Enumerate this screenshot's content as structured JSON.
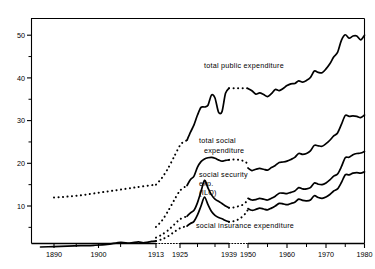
{
  "chart_data": {
    "type": "line",
    "title": "",
    "subtitle": "",
    "xlabel": "",
    "ylabel": "",
    "xlim": [
      1885,
      1980
    ],
    "ylim": [
      0,
      53
    ],
    "grid": false,
    "legend_position": "inline-annotations",
    "yticks_major": [
      10,
      20,
      30,
      40,
      50
    ],
    "yticks_minor": [
      5,
      15,
      25,
      35,
      45
    ],
    "xticks": [
      1890,
      1900,
      1913,
      1925,
      1939,
      1950,
      1960,
      1970,
      1980
    ],
    "xtick_labels": [
      "1890",
      "1900",
      "1913",
      "1925",
      "1939",
      "1950",
      "1960",
      "1970",
      "1980"
    ],
    "axis_break_spans": [
      [
        1913,
        1925
      ],
      [
        1939,
        1950
      ]
    ],
    "series": [
      {
        "name": "total public expenditure",
        "style": "mixed",
        "label_x": 1944,
        "label_y": 40.5,
        "segments": [
          {
            "style": "dotted",
            "x": [
              1890,
              1892,
              1894,
              1896,
              1898,
              1900,
              1902,
              1904,
              1906,
              1908,
              1910,
              1913
            ],
            "y": [
              12.0,
              12.1,
              12.3,
              12.5,
              12.8,
              13.1,
              13.4,
              13.7,
              14.0,
              14.3,
              14.6,
              15.0
            ]
          },
          {
            "style": "dotted",
            "x": [
              1913,
              1916,
              1919,
              1922,
              1925,
              1926,
              1927
            ],
            "y": [
              15.0,
              16.6,
              18.8,
              21.5,
              24.2,
              25.0,
              25.4
            ]
          },
          {
            "style": "solid",
            "x": [
              1927,
              1928,
              1929,
              1930,
              1931,
              1932,
              1933,
              1934,
              1935,
              1936,
              1937,
              1938,
              1939
            ],
            "y": [
              25.4,
              27.3,
              29.0,
              31.3,
              33.1,
              33.2,
              33.6,
              36.0,
              35.3,
              32.0,
              32.1,
              36.4,
              37.6
            ]
          },
          {
            "style": "dotted",
            "x": [
              1939,
              1942,
              1945,
              1948,
              1950
            ],
            "y": [
              37.6,
              37.6,
              37.6,
              37.6,
              37.6
            ]
          },
          {
            "style": "solid",
            "x": [
              1950,
              1951,
              1952,
              1953,
              1954,
              1955,
              1956,
              1957,
              1958,
              1959,
              1960,
              1961,
              1962,
              1963,
              1964,
              1965,
              1966,
              1967,
              1968,
              1969,
              1970,
              1971,
              1972,
              1973,
              1974,
              1975,
              1976,
              1977,
              1978,
              1979,
              1980
            ],
            "y": [
              37.5,
              37.0,
              36.2,
              36.5,
              36.1,
              35.6,
              36.3,
              37.3,
              37.0,
              37.5,
              38.2,
              38.6,
              38.7,
              39.3,
              39.0,
              39.4,
              40.1,
              41.6,
              41.3,
              41.2,
              42.1,
              43.3,
              44.9,
              46.0,
              48.8,
              50.1,
              49.3,
              49.8,
              49.8,
              48.9,
              50.0
            ]
          }
        ]
      },
      {
        "name": "total social expenditure",
        "style": "mixed",
        "label_x": 1941,
        "label_y": 27.5,
        "label_line2_y": 24.8,
        "segments": [
          {
            "style": "dotted",
            "x": [
              1913,
              1916,
              1919,
              1922,
              1925,
              1927
            ],
            "y": [
              5.1,
              6.6,
              8.8,
              11.3,
              13.6,
              14.8
            ]
          },
          {
            "style": "solid",
            "x": [
              1927,
              1928,
              1929,
              1930,
              1931,
              1932,
              1933,
              1934,
              1935,
              1936,
              1937,
              1938,
              1939
            ],
            "y": [
              14.8,
              16.2,
              17.0,
              19.1,
              20.4,
              21.0,
              21.3,
              21.4,
              21.2,
              20.8,
              20.5,
              20.7,
              20.8
            ]
          },
          {
            "style": "dotted",
            "x": [
              1939,
              1941,
              1943,
              1945,
              1947,
              1949,
              1950
            ],
            "y": [
              20.8,
              20.9,
              20.9,
              20.8,
              20.6,
              20.2,
              19.3
            ]
          },
          {
            "style": "solid",
            "x": [
              1950,
              1951,
              1952,
              1953,
              1954,
              1955,
              1956,
              1957,
              1958,
              1959,
              1960,
              1961,
              1962,
              1963,
              1964,
              1965,
              1966,
              1967,
              1968,
              1969,
              1970,
              1971,
              1972,
              1973,
              1974,
              1975,
              1976,
              1977,
              1978,
              1979,
              1980
            ],
            "y": [
              18.9,
              18.3,
              18.6,
              18.8,
              18.6,
              18.4,
              19.0,
              19.5,
              20.2,
              20.3,
              20.5,
              20.9,
              21.4,
              22.3,
              22.1,
              22.3,
              22.9,
              24.2,
              24.1,
              24.0,
              24.6,
              25.4,
              26.4,
              27.1,
              29.1,
              31.2,
              31.0,
              31.1,
              31.0,
              30.7,
              31.3
            ]
          }
        ]
      },
      {
        "name": "social security exp. (ILO)",
        "style": "mixed",
        "label_x": 1941,
        "label_y": 18.6,
        "segments": [
          {
            "style": "dotted",
            "x": [
              1913,
              1916,
              1919,
              1922,
              1925,
              1927
            ],
            "y": [
              2.6,
              3.3,
              4.3,
              5.6,
              6.9,
              7.6
            ]
          },
          {
            "style": "solid",
            "x": [
              1927,
              1928,
              1929,
              1930,
              1931,
              1932,
              1933,
              1934,
              1935,
              1936,
              1937,
              1938,
              1939
            ],
            "y": [
              7.6,
              8.4,
              9.0,
              10.8,
              13.4,
              16.0,
              14.2,
              12.6,
              11.6,
              11.1,
              10.6,
              10.0,
              9.6
            ]
          },
          {
            "style": "dotted",
            "x": [
              1939,
              1941,
              1943,
              1945,
              1947,
              1949,
              1950
            ],
            "y": [
              9.6,
              9.6,
              9.8,
              10.0,
              10.3,
              11.0,
              11.6
            ]
          },
          {
            "style": "solid",
            "x": [
              1950,
              1951,
              1952,
              1953,
              1954,
              1955,
              1956,
              1957,
              1958,
              1959,
              1960,
              1961,
              1962,
              1963,
              1964,
              1965,
              1966,
              1967,
              1968,
              1969,
              1970,
              1971,
              1972,
              1973,
              1974,
              1975,
              1976,
              1977,
              1978,
              1979,
              1980
            ],
            "y": [
              11.8,
              11.4,
              11.5,
              11.8,
              11.6,
              11.4,
              11.8,
              12.3,
              13.0,
              13.0,
              12.9,
              13.2,
              13.5,
              14.3,
              14.0,
              14.0,
              14.3,
              15.4,
              15.1,
              15.0,
              15.4,
              16.1,
              17.0,
              17.5,
              19.2,
              21.3,
              21.4,
              22.0,
              22.3,
              22.4,
              22.8
            ]
          }
        ]
      },
      {
        "name": "social insurance expenditure",
        "style": "mixed",
        "label_x": 1944,
        "label_y": 4.5,
        "segments": [
          {
            "style": "solid",
            "x": [
              1887,
              1890,
              1893,
              1896,
              1899,
              1902,
              1905,
              1907,
              1909,
              1910,
              1911,
              1912,
              1913
            ],
            "y": [
              0.4,
              0.5,
              0.6,
              0.7,
              0.8,
              1.0,
              1.5,
              1.3,
              1.6,
              1.4,
              1.5,
              1.7,
              1.8
            ]
          },
          {
            "style": "dotted",
            "x": [
              1913,
              1916,
              1919,
              1922,
              1925,
              1927
            ],
            "y": [
              1.8,
              2.2,
              2.9,
              3.9,
              4.8,
              5.3
            ]
          },
          {
            "style": "solid",
            "x": [
              1927,
              1928,
              1929,
              1930,
              1931,
              1932,
              1933,
              1934,
              1935,
              1936,
              1937,
              1938,
              1939
            ],
            "y": [
              5.3,
              5.9,
              6.4,
              7.9,
              10.0,
              12.1,
              10.3,
              8.7,
              7.8,
              7.3,
              7.0,
              6.6,
              6.3
            ]
          },
          {
            "style": "dotted",
            "x": [
              1939,
              1941,
              1943,
              1945,
              1947,
              1949,
              1950
            ],
            "y": [
              6.3,
              6.4,
              6.6,
              7.0,
              7.6,
              8.5,
              9.2
            ]
          },
          {
            "style": "solid",
            "x": [
              1950,
              1951,
              1952,
              1953,
              1954,
              1955,
              1956,
              1957,
              1958,
              1959,
              1960,
              1961,
              1962,
              1963,
              1964,
              1965,
              1966,
              1967,
              1968,
              1969,
              1970,
              1971,
              1972,
              1973,
              1974,
              1975,
              1976,
              1977,
              1978,
              1979,
              1980
            ],
            "y": [
              9.4,
              9.0,
              9.2,
              9.5,
              9.3,
              9.1,
              9.5,
              10.0,
              10.6,
              10.5,
              10.3,
              10.6,
              10.9,
              11.6,
              11.3,
              11.2,
              11.4,
              12.4,
              12.0,
              11.8,
              12.1,
              12.7,
              13.5,
              14.0,
              15.5,
              17.3,
              17.3,
              17.7,
              17.8,
              17.7,
              18.0
            ]
          }
        ]
      }
    ],
    "annotations": [
      {
        "id": "label-total-public",
        "text": "total public expenditure"
      },
      {
        "id": "label-total-social-l1",
        "text": "total  social"
      },
      {
        "id": "label-total-social-l2",
        "text": "expenditure"
      },
      {
        "id": "label-social-security-l1",
        "text": "social  security"
      },
      {
        "id": "label-social-security-l2",
        "text": "exp."
      },
      {
        "id": "label-social-security-l3",
        "text": "(ILO)"
      },
      {
        "id": "label-social-insurance",
        "text": "social insurance expenditure"
      }
    ]
  },
  "colors": {
    "line": "#000000",
    "axis": "#000000",
    "background": "#ffffff"
  }
}
